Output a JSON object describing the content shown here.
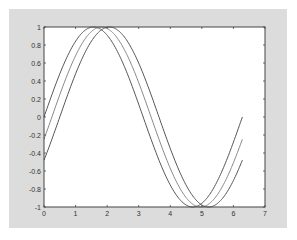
{
  "figure": {
    "background": "#dcdcdc",
    "axes_background": "#ffffff",
    "axes_color": "#444444"
  },
  "chart_data": {
    "type": "line",
    "title": "",
    "xlabel": "",
    "ylabel": "",
    "xlim": [
      0,
      7
    ],
    "ylim": [
      -1,
      1
    ],
    "grid": false,
    "legend": null,
    "xticks": [
      "0",
      "1",
      "2",
      "3",
      "4",
      "5",
      "6",
      "7"
    ],
    "yticks": [
      "-1",
      "-0.8",
      "-0.6",
      "-0.4",
      "-0.2",
      "0",
      "0.2",
      "0.4",
      "0.6",
      "0.8",
      "1"
    ],
    "series": [
      {
        "name": "sin(x)",
        "expression": "sin(x)",
        "x_range": [
          0,
          6.283
        ],
        "color": "#555555",
        "x": [
          0,
          0.5,
          1,
          1.5,
          1.571,
          2,
          2.5,
          3,
          3.5,
          4,
          4.5,
          4.712,
          5,
          5.5,
          6,
          6.283
        ],
        "y": [
          0,
          0.479,
          0.841,
          0.997,
          1,
          0.909,
          0.598,
          0.141,
          -0.351,
          -0.757,
          -0.978,
          -1,
          -0.959,
          -0.706,
          -0.279,
          0
        ]
      },
      {
        "name": "sin(x-0.25)",
        "expression": "sin(x-0.25)",
        "x_range": [
          0,
          6.283
        ],
        "color": "#888888",
        "x": [
          0,
          0.5,
          1,
          1.5,
          1.821,
          2,
          2.5,
          3,
          3.5,
          4,
          4.5,
          4.962,
          5,
          5.5,
          6,
          6.283
        ],
        "y": [
          -0.247,
          0.247,
          0.682,
          0.949,
          1,
          0.984,
          0.778,
          0.382,
          -0.108,
          -0.572,
          -0.895,
          -1,
          -0.999,
          -0.859,
          -0.501,
          -0.247
        ]
      },
      {
        "name": "sin(x-0.5)",
        "expression": "sin(x-0.5)",
        "x_range": [
          0,
          6.283
        ],
        "color": "#555555",
        "x": [
          0,
          0.5,
          1,
          1.5,
          2.071,
          2.5,
          3,
          3.5,
          4,
          4.5,
          5,
          5.212,
          5.5,
          6,
          6.283
        ],
        "y": [
          -0.479,
          0,
          0.479,
          0.841,
          1,
          0.909,
          0.598,
          0.141,
          -0.351,
          -0.757,
          -0.978,
          -1,
          -0.959,
          -0.706,
          -0.479
        ]
      }
    ]
  }
}
